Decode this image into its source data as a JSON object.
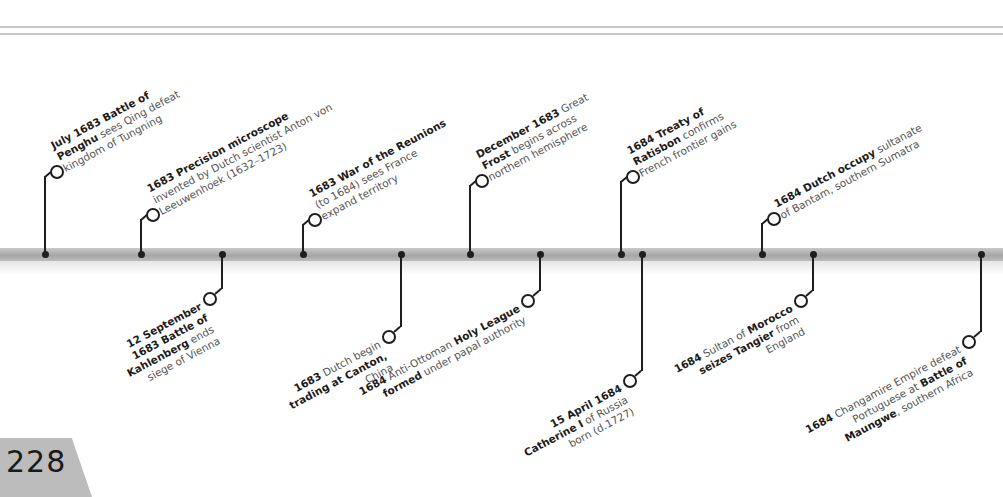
{
  "page": {
    "number": "228"
  },
  "timeline": {
    "above": [
      {
        "id": "penghu",
        "x": 45,
        "ringY": 167,
        "lines": [
          [
            {
              "b": "July 1683 Battle of"
            }
          ],
          [
            {
              "b": "Penghu"
            },
            {
              "t": " sees Qing defeat"
            }
          ],
          [
            {
              "t": "kingdom of Tungning"
            }
          ]
        ]
      },
      {
        "id": "microscope",
        "x": 141,
        "ringY": 210,
        "lines": [
          [
            {
              "b": "1683 Precision microscope"
            }
          ],
          [
            {
              "t": "invented by Dutch scientist Anton von"
            }
          ],
          [
            {
              "t": "Leeuwenhoek (1632–1723)"
            }
          ]
        ]
      },
      {
        "id": "reunions",
        "x": 303,
        "ringY": 215,
        "lines": [
          [
            {
              "b": "1683 War of the Reunions"
            }
          ],
          [
            {
              "t": "(to 1684) sees France"
            }
          ],
          [
            {
              "t": "expand territory"
            }
          ]
        ]
      },
      {
        "id": "frost",
        "x": 470,
        "ringY": 176,
        "lines": [
          [
            {
              "b": "December 1683"
            },
            {
              "t": " Great"
            }
          ],
          [
            {
              "b": "Frost"
            },
            {
              "t": " begins across"
            }
          ],
          [
            {
              "t": "northern hemisphere"
            }
          ]
        ]
      },
      {
        "id": "ratisbon",
        "x": 621,
        "ringY": 172,
        "lines": [
          [
            {
              "b": "1684 Treaty of"
            }
          ],
          [
            {
              "b": "Ratisbon"
            },
            {
              "t": " confirms"
            }
          ],
          [
            {
              "t": "French frontier gains"
            }
          ]
        ]
      },
      {
        "id": "bantam",
        "x": 762,
        "ringY": 214,
        "lines": [
          [
            {
              "b": "1684 Dutch occupy"
            },
            {
              "t": " sultanate"
            }
          ],
          [
            {
              "t": "of Bantam, southern Sumatra"
            }
          ]
        ]
      }
    ],
    "below": [
      {
        "id": "kahlenberg",
        "x": 222,
        "ringY": 294,
        "lines": [
          [
            {
              "b": "12 September"
            }
          ],
          [
            {
              "b": "1683 Battle of"
            }
          ],
          [
            {
              "b": "Kahlenberg"
            },
            {
              "t": " ends"
            }
          ],
          [
            {
              "t": "siege of Vienna"
            }
          ]
        ]
      },
      {
        "id": "canton",
        "x": 401,
        "ringY": 332,
        "lines": [
          [
            {
              "b": "1683"
            },
            {
              "t": " Dutch begin"
            }
          ],
          [
            {
              "b": "trading at Canton,"
            }
          ],
          [
            {
              "t": "China"
            }
          ]
        ]
      },
      {
        "id": "holyleague",
        "x": 540,
        "ringY": 296,
        "lines": [
          [
            {
              "b": "1684"
            },
            {
              "t": " Anti-Ottoman "
            },
            {
              "b": "Holy League"
            }
          ],
          [
            {
              "b": "formed"
            },
            {
              "t": " under papal authority"
            }
          ]
        ]
      },
      {
        "id": "catherine",
        "x": 642,
        "ringY": 376,
        "lines": [
          [
            {
              "b": "15 April 1684"
            }
          ],
          [
            {
              "b": "Catherine I"
            },
            {
              "t": " of Russia"
            }
          ],
          [
            {
              "t": "born (d.1727)"
            }
          ]
        ]
      },
      {
        "id": "tangier",
        "x": 813,
        "ringY": 296,
        "lines": [
          [
            {
              "b": "1684"
            },
            {
              "t": " Sultan of "
            },
            {
              "b": "Morocco"
            }
          ],
          [
            {
              "b": "seizes Tangier"
            },
            {
              "t": " from"
            }
          ],
          [
            {
              "t": "England"
            }
          ]
        ]
      },
      {
        "id": "maungwe",
        "x": 981,
        "ringY": 337,
        "lines": [
          [
            {
              "b": "1684"
            },
            {
              "t": " Changamire Empire defeat"
            }
          ],
          [
            {
              "t": "Portuguese at "
            },
            {
              "b": "Battle of"
            }
          ],
          [
            {
              "b": "Maungwe"
            },
            {
              "t": ", southern Africa"
            }
          ]
        ]
      }
    ]
  },
  "colors": {
    "bar": "#b0b0b0",
    "ink": "#1e1e1e",
    "tab": "#bcbcbc",
    "rule": "#c8c8c8"
  }
}
